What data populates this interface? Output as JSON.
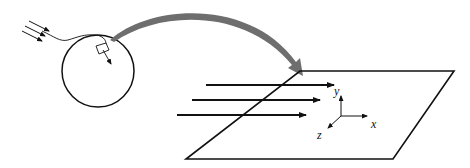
{
  "diagram": {
    "colors": {
      "stroke": "#111111",
      "curved_arrow": "#6e6e6e",
      "background": "#ffffff"
    },
    "axes": {
      "y_label": "y",
      "x_label": "x",
      "z_label": "z"
    },
    "incoming_rays_count": 3,
    "plane_rays_count": 3
  }
}
